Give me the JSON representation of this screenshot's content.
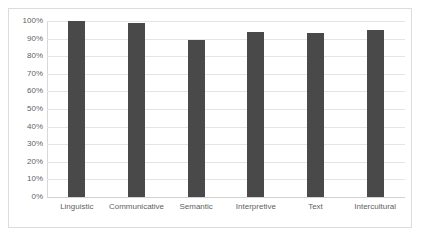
{
  "chart_data": {
    "type": "bar",
    "title": "",
    "subtitle": "",
    "xlabel": "",
    "ylabel": "",
    "categories": [
      "Linguistic",
      "Communicative",
      "Semantic",
      "Interpretive",
      "Text",
      "Intercultural"
    ],
    "values": [
      100,
      99,
      89,
      94,
      93,
      95
    ],
    "series": [
      {
        "name": "",
        "values": [
          100,
          99,
          89,
          94,
          93,
          95
        ]
      }
    ],
    "ylim": [
      0,
      100
    ],
    "y_tick_labels": [
      "100%",
      "90%",
      "80%",
      "70%",
      "60%",
      "50%",
      "40%",
      "30%",
      "20%",
      "10%",
      "0%"
    ],
    "y_tick_values": [
      100,
      90,
      80,
      70,
      60,
      50,
      40,
      30,
      20,
      10,
      0
    ],
    "value_format": "percent",
    "grid": true,
    "grid_axis": "y",
    "legend": false,
    "legend_position": "none",
    "annotations": [],
    "colors": {
      "bar": "#494949",
      "gridline": "#e4e4e4",
      "axis_line": "#d8d8d8",
      "frame_border": "#dcdcdc",
      "plot_background": "#ffffff",
      "tick_label_text": "#5f5f5f"
    }
  }
}
